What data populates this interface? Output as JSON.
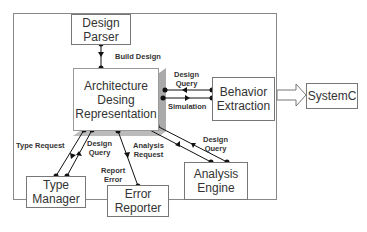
{
  "nodes": {
    "design_parser": "Design\nParser",
    "architecture": "Architecture\nDesing\nRepresentation",
    "behavior_extraction": "Behavior\nExtraction",
    "systemc": "SystemC",
    "type_manager": "Type\nManager",
    "error_reporter": "Error\nReporter",
    "analysis_engine": "Analysis\nEngine"
  },
  "edges": {
    "build_design": "Build Design",
    "design_query_behavior": "Design\nQuery",
    "simulation": "Simulation",
    "type_request": "Type Request",
    "design_query_type": "Design\nQuery",
    "report_error": "Report\nError",
    "analysis_request": "Analysis\nRequest",
    "design_query_analysis": "Design\nQuery"
  },
  "caption": ""
}
